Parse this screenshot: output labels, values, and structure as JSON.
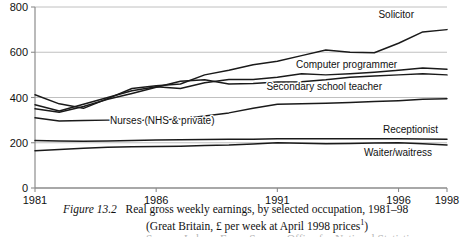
{
  "chart_data": {
    "type": "line",
    "title": "Real gross weekly earnings, by selected occupation, 1981–98",
    "subtitle": "(Great Britain, £ per week at April 1998 prices)",
    "figure_number": "Figure 13.2",
    "xlabel": "",
    "ylabel": "",
    "xlim": [
      1981,
      1998
    ],
    "ylim": [
      0,
      800
    ],
    "grid": true,
    "legend": "inline-labels",
    "yticks": [
      0,
      200,
      400,
      600,
      800
    ],
    "xticks": [
      1981,
      1986,
      1991,
      1996,
      1998
    ],
    "x": [
      1981,
      1982,
      1983,
      1984,
      1985,
      1986,
      1987,
      1988,
      1989,
      1990,
      1991,
      1992,
      1993,
      1994,
      1995,
      1996,
      1997,
      1998
    ],
    "series": [
      {
        "name": "Solicitor",
        "label": "Solicitor",
        "values": [
          412,
          372,
          352,
          395,
          440,
          452,
          460,
          500,
          520,
          545,
          560,
          585,
          610,
          600,
          598,
          640,
          690,
          700
        ]
      },
      {
        "name": "Computer programmer",
        "label": "Computer programmer",
        "values": [
          368,
          340,
          370,
          400,
          430,
          448,
          440,
          465,
          480,
          480,
          490,
          505,
          500,
          505,
          512,
          520,
          530,
          525
        ]
      },
      {
        "name": "Secondary school teacher",
        "label": "Secondary school teacher",
        "values": [
          350,
          335,
          360,
          392,
          418,
          445,
          472,
          478,
          460,
          462,
          468,
          470,
          478,
          490,
          495,
          500,
          505,
          500
        ]
      },
      {
        "name": "Nurses (NHS & private)",
        "label": "Nurses (NHS & private)",
        "values": [
          310,
          296,
          298,
          300,
          300,
          300,
          305,
          318,
          332,
          352,
          370,
          372,
          375,
          378,
          382,
          386,
          392,
          395
        ]
      },
      {
        "name": "Receptionist",
        "label": "Receptionist",
        "values": [
          210,
          208,
          207,
          208,
          210,
          212,
          213,
          214,
          215,
          216,
          218,
          218,
          218,
          218,
          218,
          218,
          217,
          215
        ]
      },
      {
        "name": "Waiter/waitress",
        "label": "Waiter/waitress",
        "values": [
          165,
          170,
          176,
          180,
          182,
          183,
          185,
          188,
          190,
          195,
          200,
          198,
          196,
          197,
          199,
          200,
          196,
          190
        ]
      }
    ],
    "series_label_positions": [
      {
        "name": "Solicitor",
        "x": 414,
        "y": 18
      },
      {
        "name": "Computer programmer",
        "x": 296,
        "y": 68
      },
      {
        "name": "Secondary school teacher",
        "x": 382,
        "y": 90
      },
      {
        "name": "Nurses (NHS & private)",
        "x": 110,
        "y": 124
      },
      {
        "name": "Receptionist",
        "x": 438,
        "y": 133
      },
      {
        "name": "Waiter/waitress",
        "x": 432,
        "y": 156
      }
    ]
  },
  "caption": {
    "figure_label": "Figure 13.2",
    "line1": "Real gross weekly earnings, by selected occupation, 1981–98",
    "line2_pre": "(Great Britain, £ per week at April 1998 prices",
    "line2_sup": "1",
    "line2_post": ")",
    "line3": "Source: Labour Force Survey, Office for National Statistics"
  },
  "axis": {
    "y_labels": [
      "800",
      "600",
      "400",
      "200",
      "0"
    ],
    "x_labels": [
      "1981",
      "1986",
      "1991",
      "1996",
      "1998"
    ]
  },
  "colors": {
    "line": "#1a1a1a",
    "grid": "#b9b9b9",
    "axis": "#8c8c8c",
    "text": "#111111",
    "background": "#ffffff"
  }
}
